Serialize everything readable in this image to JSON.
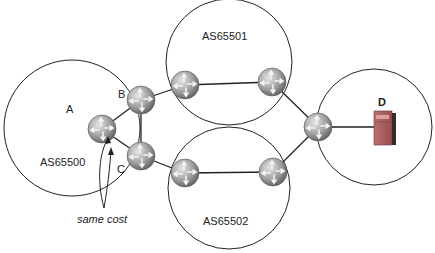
{
  "diagram": {
    "autonomous_systems": [
      {
        "id": "as65500",
        "label": "AS65500"
      },
      {
        "id": "as65501",
        "label": "AS65501"
      },
      {
        "id": "as65502",
        "label": "AS65502"
      },
      {
        "id": "as-dest",
        "label": ""
      }
    ],
    "nodes": {
      "router_a": {
        "label": "A"
      },
      "router_b": {
        "label": "B"
      },
      "router_c": {
        "label": "C"
      },
      "server_d": {
        "label": "D"
      }
    },
    "annotation": {
      "text": "same cost"
    },
    "colors": {
      "router_fill": "#9a9a9a",
      "line": "#222222",
      "server": "#a05a5a"
    }
  }
}
